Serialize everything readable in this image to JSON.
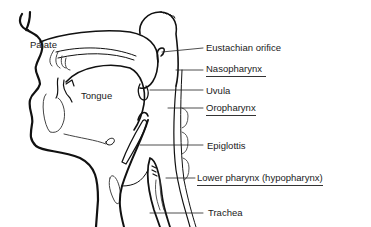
{
  "diagram": {
    "type": "anatomical-cross-section",
    "colors": {
      "line": "#111111",
      "text": "#1a1a1a",
      "background": "#ffffff"
    },
    "inline_labels": [
      {
        "id": "palate",
        "text": "Palate"
      },
      {
        "id": "tongue",
        "text": "Tongue"
      }
    ],
    "callouts": [
      {
        "id": "eustachian",
        "text": "Eustachian orifice",
        "underlined": false
      },
      {
        "id": "nasopharynx",
        "text": "Nasopharynx",
        "underlined": true
      },
      {
        "id": "uvula",
        "text": "Uvula",
        "underlined": false
      },
      {
        "id": "oropharynx",
        "text": "Oropharynx",
        "underlined": true
      },
      {
        "id": "epiglottis",
        "text": "Epiglottis",
        "underlined": false
      },
      {
        "id": "lower_pharynx",
        "text": "Lower pharynx (hypopharynx)",
        "underlined": true
      },
      {
        "id": "trachea",
        "text": "Trachea",
        "underlined": false
      }
    ]
  }
}
